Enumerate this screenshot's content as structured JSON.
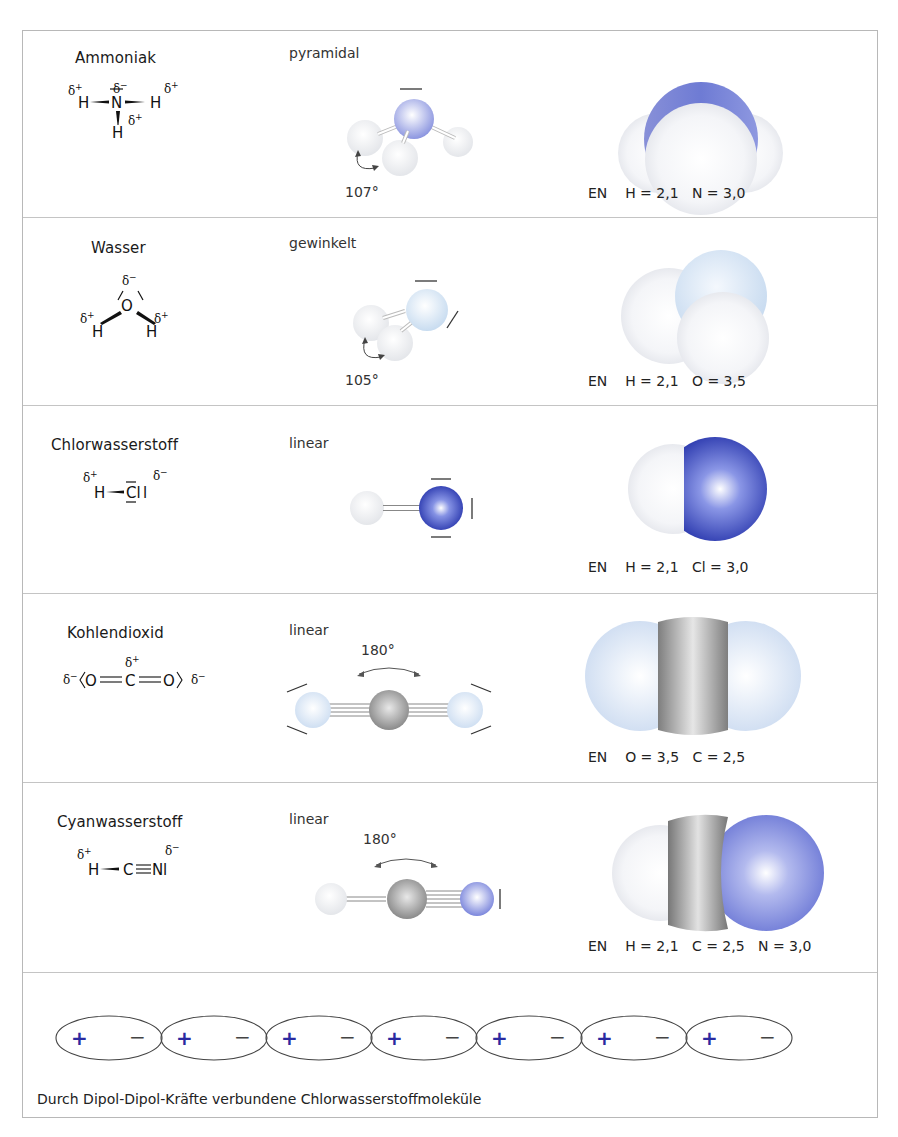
{
  "molecules": [
    {
      "name": "Ammoniak",
      "shape": "pyramidal",
      "formula": {
        "atoms": "H–N–H / H",
        "partial_charges": [
          "δ+",
          "δ−",
          "δ+",
          "δ+"
        ]
      },
      "bond_angle": "107°",
      "en": {
        "label": "EN",
        "values": [
          "H = 2,1",
          "N = 3,0"
        ]
      },
      "colors": {
        "central": "#8c96e0",
        "outer": "#eef0f4"
      }
    },
    {
      "name": "Wasser",
      "shape": "gewinkelt",
      "formula": {
        "atoms": "H–O–H",
        "partial_charges": [
          "δ−",
          "δ+",
          "δ+"
        ]
      },
      "bond_angle": "105°",
      "en": {
        "label": "EN",
        "values": [
          "H = 2,1",
          "O = 3,5"
        ]
      },
      "colors": {
        "central": "#cfe0f2",
        "outer": "#eef0f4"
      }
    },
    {
      "name": "Chlorwasserstoff",
      "shape": "linear",
      "formula": {
        "atoms": "H–Cl",
        "partial_charges": [
          "δ+",
          "δ−"
        ]
      },
      "en": {
        "label": "EN",
        "values": [
          "H = 2,1",
          "Cl = 3,0"
        ]
      },
      "colors": {
        "central": "#2c3ab0",
        "outer": "#eef0f4"
      }
    },
    {
      "name": "Kohlendioxid",
      "shape": "linear",
      "formula": {
        "atoms": "O=C=O",
        "partial_charges": [
          "δ−",
          "δ+",
          "δ−"
        ]
      },
      "bond_angle": "180°",
      "en": {
        "label": "EN",
        "values": [
          "O = 3,5",
          "C = 2,5"
        ]
      },
      "colors": {
        "central": "#8a8a8a",
        "outer": "#d8e4f4"
      }
    },
    {
      "name": "Cyanwasserstoff",
      "shape": "linear",
      "formula": {
        "atoms": "H–C≡N",
        "partial_charges": [
          "δ+",
          "δ−"
        ]
      },
      "bond_angle": "180°",
      "en": {
        "label": "EN",
        "values": [
          "H = 2,1",
          "C = 2,5",
          "N = 3,0"
        ]
      },
      "colors": {
        "h": "#eef0f4",
        "c": "#8a8a8a",
        "n": "#7b86dc"
      }
    }
  ],
  "dipole_chain": {
    "count": 7,
    "plus": "+",
    "minus": "−",
    "plus_color": "#2a2aa0",
    "caption": "Durch Dipol-Dipol-Kräfte verbundene Chlorwasserstoffmoleküle"
  }
}
